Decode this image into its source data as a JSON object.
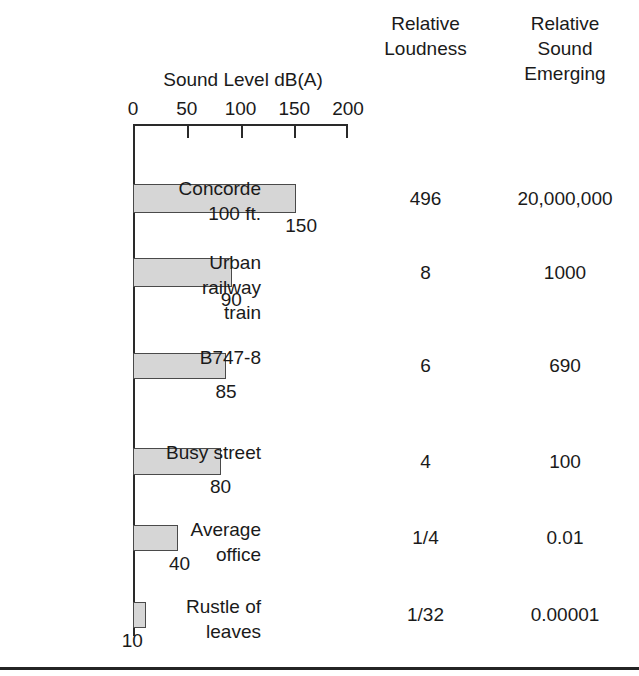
{
  "figure": {
    "columns": {
      "loudness_header": "Relative\nLoudness",
      "emerging_header": "Relative\nSound\nEmerging"
    },
    "axis_title": "Sound Level dB(A)"
  },
  "chart_data": {
    "type": "bar",
    "orientation": "horizontal",
    "title": "Sound Level dB(A)",
    "xlabel": "Sound Level dB(A)",
    "ylabel": "",
    "xlim": [
      0,
      200
    ],
    "xticks": [
      0,
      50,
      100,
      150,
      200
    ],
    "xtick_labels": [
      "0",
      "50",
      "100",
      "150",
      "200"
    ],
    "grid": false,
    "legend": null,
    "bar_color": "#d6d6d6",
    "bar_edge_color": "#4a4a4a",
    "categories": [
      "Concorde\n100 ft.",
      "Urban\nrailway\ntrain",
      "B747-8",
      "Busy street",
      "Average\noffice",
      "Rustle of\nleaves"
    ],
    "values": [
      150,
      90,
      85,
      80,
      40,
      10
    ],
    "value_labels": [
      "150",
      "90",
      "85",
      "80",
      "40",
      "10"
    ],
    "extra_columns": [
      {
        "name": "Relative Loudness",
        "values": [
          "496",
          "8",
          "6",
          "4",
          "1/4",
          "1/32"
        ]
      },
      {
        "name": "Relative Sound Emerging",
        "values": [
          "20,000,000",
          "1000",
          "690",
          "100",
          "0.01",
          "0.00001"
        ]
      }
    ]
  }
}
